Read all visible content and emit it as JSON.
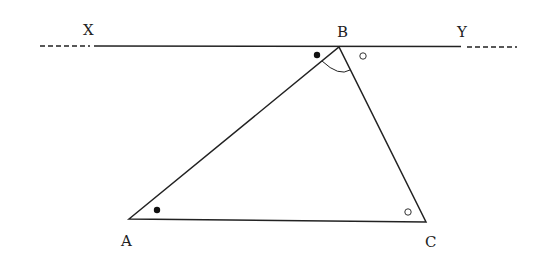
{
  "labels": {
    "X": "X",
    "Y": "Y",
    "A": "A",
    "B": "B",
    "C": "C"
  },
  "diagram": {
    "points": {
      "A": [
        129,
        219
      ],
      "B": [
        339,
        47
      ],
      "C": [
        426,
        222
      ]
    },
    "line_XY_y": 46,
    "markers": [
      {
        "type": "filled-dot",
        "at": "angle XBA"
      },
      {
        "type": "hollow-dot",
        "at": "angle YBC"
      },
      {
        "type": "filled-dot",
        "at": "angle BAC"
      },
      {
        "type": "hollow-dot",
        "at": "angle BCA"
      },
      {
        "type": "arc",
        "at": "angle ABC"
      }
    ],
    "colors": {
      "stroke": "#222222",
      "background": "#ffffff"
    }
  }
}
